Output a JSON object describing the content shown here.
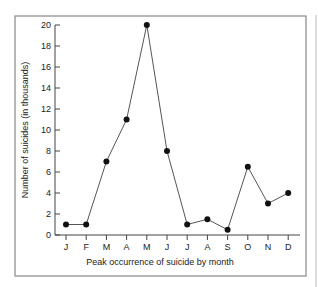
{
  "chart_data": {
    "type": "line",
    "title": "",
    "xlabel": "Peak occurrence of suicide by month",
    "ylabel": "Number of suicides (in thousands)",
    "categories": [
      "J",
      "F",
      "M",
      "A",
      "M",
      "J",
      "J",
      "A",
      "S",
      "O",
      "N",
      "D"
    ],
    "values": [
      1,
      1,
      7,
      11,
      20,
      8,
      1,
      1.5,
      0.5,
      6.5,
      3,
      4
    ],
    "yticks": [
      0,
      2,
      4,
      6,
      8,
      10,
      12,
      14,
      16,
      18,
      20
    ],
    "ylim": [
      0,
      20
    ],
    "grid": false,
    "legend": null
  },
  "colors": {
    "line": "#555555",
    "marker": "#111111",
    "frame": "#888888",
    "axis": "#444444"
  }
}
